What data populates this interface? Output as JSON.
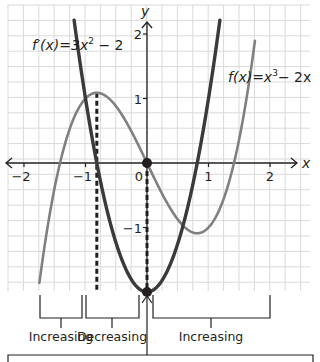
{
  "chart_data": {
    "type": "line",
    "title": "",
    "xlabel": "x",
    "ylabel": "y",
    "xlim": [
      -2.3,
      2.6
    ],
    "ylim": [
      -2.0,
      2.4
    ],
    "grid": true,
    "x_ticks": [
      -2,
      -1,
      0,
      1,
      2
    ],
    "x_tick_labels": [
      "−2",
      "−1",
      "0",
      "1",
      "2"
    ],
    "y_ticks": [
      -1,
      1,
      2
    ],
    "y_tick_labels": [
      "−1",
      "1",
      "2"
    ],
    "origin_label": "0",
    "series": [
      {
        "name": "f(x)=x³−2x",
        "label_base": "f(x)=x",
        "label_exp": "3",
        "label_tail": "− 2x",
        "color": "#808080",
        "formula": "x^3 - 2x",
        "key_points": [
          {
            "x": -1.64,
            "y": -1.14
          },
          {
            "x": -1.414,
            "y": 0
          },
          {
            "x": -0.816,
            "y": 1.089
          },
          {
            "x": 0,
            "y": 0
          },
          {
            "x": 0.816,
            "y": -1.089
          },
          {
            "x": 1.414,
            "y": 0
          },
          {
            "x": 1.75,
            "y": 1.86
          }
        ]
      },
      {
        "name": "f′(x)=3x²−2",
        "label_base": "f′(x)=3x",
        "label_exp": "2",
        "label_tail": " − 2",
        "color": "#3a3a3a",
        "formula": "3x^2 - 2",
        "key_points": [
          {
            "x": -1.18,
            "y": 2.2
          },
          {
            "x": -0.816,
            "y": 0
          },
          {
            "x": 0,
            "y": -2
          },
          {
            "x": 0.816,
            "y": 0
          },
          {
            "x": 1.18,
            "y": 2.2
          }
        ]
      }
    ],
    "annotations": {
      "dashed_lines_x": [
        -0.816,
        0
      ],
      "marked_points": [
        {
          "x": 0,
          "y": 0
        },
        {
          "x": 0,
          "y": -2
        }
      ],
      "intervals": [
        {
          "label": "Increasing",
          "from": -1.75,
          "to": -1.05
        },
        {
          "label": "Decreasing",
          "from": -0.99,
          "to": -0.13
        },
        {
          "label": "Increasing",
          "from": 0.09,
          "to": 2.0
        }
      ]
    }
  },
  "labels": {
    "x_axis": "x",
    "y_axis": "y",
    "interval_1": "Increasing",
    "interval_2": "Decreasing",
    "interval_3": "Increasing"
  }
}
